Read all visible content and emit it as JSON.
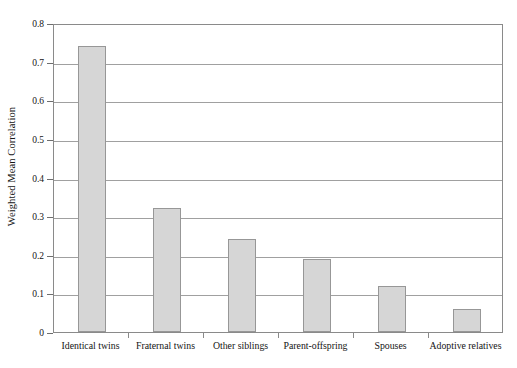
{
  "chart_data": {
    "type": "bar",
    "title": "",
    "xlabel": "",
    "ylabel": "Weighted Mean Correlation",
    "ylim": [
      0,
      0.8
    ],
    "ytick_labels": [
      "0.8",
      "0.7",
      "0.6",
      "0.5",
      "0.4",
      "0.3",
      "0.2",
      "0.1",
      "0"
    ],
    "ytick_values": [
      0.8,
      0.7,
      0.6,
      0.5,
      0.4,
      0.3,
      0.2,
      0.1,
      0
    ],
    "grid": true,
    "legend": "none",
    "categories": [
      "Identical twins",
      "Fraternal twins",
      "Other siblings",
      "Parent-offspring",
      "Spouses",
      "Adoptive relatives"
    ],
    "values": [
      0.74,
      0.32,
      0.24,
      0.19,
      0.12,
      0.06
    ],
    "bar_fill_color": "#d6d6d6",
    "bar_border_color": "#979797",
    "axis_color": "#8a8a8a",
    "gridline_color": "#a0a0a0",
    "background_color": "#ffffff"
  }
}
